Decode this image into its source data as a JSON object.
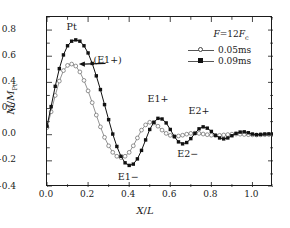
{
  "chart_data": {
    "type": "line",
    "title": "",
    "xlabel": "X/L",
    "ylabel": "M/M_Pt",
    "xlim": [
      0.0,
      1.1
    ],
    "ylim": [
      -0.4,
      0.9
    ],
    "grid": false,
    "legend_position": "top-right",
    "legend_title": "F = 12F_c",
    "xticks": [
      0.0,
      0.2,
      0.4,
      0.6,
      0.8,
      1.0
    ],
    "xtick_labels": [
      "0.0",
      "0.2",
      "0.4",
      "0.6",
      "0.8",
      "1.0"
    ],
    "yticks": [
      0.8,
      0.6,
      0.4,
      0.2,
      0.0,
      -0.2,
      -0.4
    ],
    "ytick_labels": [
      "0.8",
      "0.6",
      "0.4",
      "0.2",
      "0.0",
      "−0.2",
      "−0.4"
    ],
    "series": [
      {
        "name": "0.05ms",
        "marker": "open-circle",
        "color": "#777777",
        "x": [
          0.0,
          0.02,
          0.04,
          0.06,
          0.08,
          0.1,
          0.12,
          0.14,
          0.16,
          0.18,
          0.2,
          0.22,
          0.24,
          0.26,
          0.28,
          0.3,
          0.32,
          0.34,
          0.36,
          0.38,
          0.4,
          0.42,
          0.44,
          0.46,
          0.48,
          0.5,
          0.52,
          0.54,
          0.56,
          0.58,
          0.6,
          0.62,
          0.64,
          0.66,
          0.68,
          0.7,
          0.72,
          0.74,
          0.76,
          0.78,
          0.8,
          0.82,
          0.84,
          0.86,
          0.88,
          0.9,
          0.92,
          0.94,
          0.96,
          0.98,
          1.0,
          1.02,
          1.04,
          1.06,
          1.08,
          1.1
        ],
        "y": [
          0.055,
          0.175,
          0.3,
          0.41,
          0.49,
          0.53,
          0.54,
          0.525,
          0.48,
          0.415,
          0.335,
          0.245,
          0.15,
          0.06,
          -0.02,
          -0.085,
          -0.135,
          -0.165,
          -0.175,
          -0.165,
          -0.135,
          -0.085,
          -0.025,
          0.035,
          0.075,
          0.095,
          0.09,
          0.065,
          0.035,
          0.01,
          -0.005,
          -0.012,
          -0.01,
          -0.004,
          0.004,
          0.01,
          0.012,
          0.01,
          0.005,
          0.0,
          -0.004,
          -0.006,
          -0.005,
          -0.002,
          0.001,
          0.004,
          0.005,
          0.004,
          0.002,
          0.0,
          -0.001,
          -0.002,
          -0.001,
          0.0,
          0.001,
          0.001
        ]
      },
      {
        "name": "0.09ms",
        "marker": "filled-square",
        "color": "#111111",
        "x": [
          0.0,
          0.02,
          0.04,
          0.06,
          0.08,
          0.1,
          0.12,
          0.14,
          0.16,
          0.18,
          0.2,
          0.22,
          0.24,
          0.26,
          0.28,
          0.3,
          0.32,
          0.34,
          0.36,
          0.38,
          0.4,
          0.42,
          0.44,
          0.46,
          0.48,
          0.5,
          0.52,
          0.54,
          0.56,
          0.58,
          0.6,
          0.62,
          0.64,
          0.66,
          0.68,
          0.7,
          0.72,
          0.74,
          0.76,
          0.78,
          0.8,
          0.82,
          0.84,
          0.86,
          0.88,
          0.9,
          0.92,
          0.94,
          0.96,
          0.98,
          1.0,
          1.02,
          1.04,
          1.06,
          1.08,
          1.1
        ],
        "y": [
          0.065,
          0.215,
          0.37,
          0.505,
          0.61,
          0.68,
          0.715,
          0.725,
          0.715,
          0.68,
          0.625,
          0.545,
          0.45,
          0.345,
          0.23,
          0.115,
          0.005,
          -0.09,
          -0.165,
          -0.215,
          -0.235,
          -0.225,
          -0.185,
          -0.12,
          -0.04,
          0.04,
          0.095,
          0.125,
          0.12,
          0.09,
          0.04,
          -0.015,
          -0.055,
          -0.07,
          -0.06,
          -0.03,
          0.01,
          0.045,
          0.06,
          0.05,
          0.025,
          -0.005,
          -0.025,
          -0.032,
          -0.025,
          -0.008,
          0.01,
          0.02,
          0.022,
          0.015,
          0.005,
          0.0,
          0.002,
          0.005,
          0.006,
          0.005
        ]
      }
    ],
    "annotations": [
      {
        "text": "Pt",
        "x": 0.125,
        "y": 0.815
      },
      {
        "text": "(E1+)",
        "x": 0.3,
        "y": 0.56
      },
      {
        "text": "E1−",
        "x": 0.4,
        "y": -0.33
      },
      {
        "text": "E1+",
        "x": 0.545,
        "y": 0.265
      },
      {
        "text": "E2+",
        "x": 0.745,
        "y": 0.175
      },
      {
        "text": "E2−",
        "x": 0.69,
        "y": -0.155
      }
    ],
    "arrow": {
      "from_x": 0.285,
      "from_y": 0.545,
      "to_x": 0.155,
      "to_y": 0.54
    }
  },
  "axes": {
    "xlabel_num": "X",
    "xlabel_den": "L",
    "ylabel_num": "M",
    "ylabel_den": "M",
    "ylabel_sub": "Pt"
  },
  "legend": {
    "title_f": "F",
    "title_eq": "=12",
    "title_fc": "F",
    "title_sub": "c",
    "items": [
      {
        "label": "0.05ms",
        "marker": "open-circle"
      },
      {
        "label": "0.09ms",
        "marker": "filled-square"
      }
    ]
  }
}
